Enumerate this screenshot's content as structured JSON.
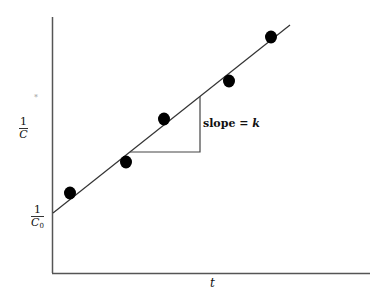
{
  "chart_data": {
    "type": "scatter",
    "title": "",
    "xlabel": "t",
    "ylabel": "1/C",
    "y_intercept_label": "1/C0",
    "annotation": "slope = k",
    "grid": false,
    "legend": null,
    "points": [
      {
        "x": 70,
        "y": 193
      },
      {
        "x": 126,
        "y": 162
      },
      {
        "x": 164,
        "y": 119
      },
      {
        "x": 229,
        "y": 81
      },
      {
        "x": 271,
        "y": 37
      }
    ],
    "fit_line": {
      "x1": 53,
      "y1": 213,
      "x2": 290,
      "y2": 25
    },
    "slope_triangle": {
      "x1": 130,
      "y_base": 152,
      "x2": 200,
      "y_top": 96
    }
  },
  "labels": {
    "y_axis_num": "1",
    "y_axis_den": "C",
    "intercept_num": "1",
    "intercept_den": "C",
    "intercept_sub": "0",
    "slope_text": "slope = ",
    "slope_var": "k",
    "x_axis": "t",
    "stray_mark": "*"
  }
}
